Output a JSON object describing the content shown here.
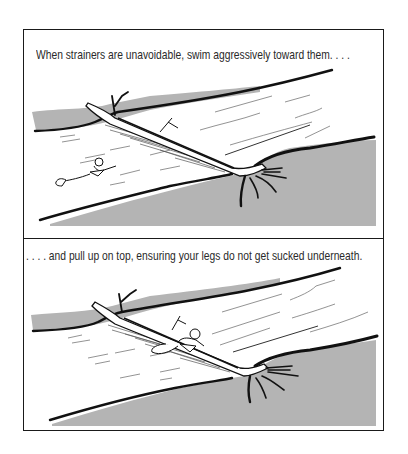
{
  "panels": [
    {
      "caption": "When strainers are unavoidable, swim aggressively toward them. . . .",
      "scene": "swimmer approaching fallen tree strainer in river"
    },
    {
      "caption": ". . . . and pull up on top, ensuring your legs do not get sucked underneath.",
      "scene": "swimmer pulling up onto fallen tree strainer"
    }
  ],
  "colors": {
    "bank_gray": "#b4b4b4",
    "ink": "#1a1a1a",
    "background": "#ffffff"
  }
}
